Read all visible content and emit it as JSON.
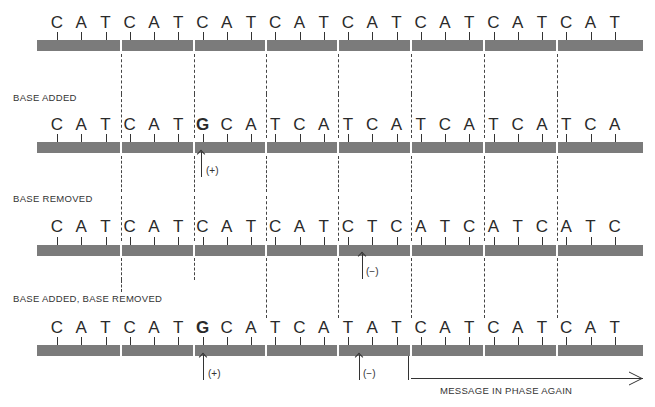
{
  "title_partial": "",
  "rows": [
    {
      "label": "",
      "sequence": [
        "C",
        "A",
        "T",
        "C",
        "A",
        "T",
        "C",
        "A",
        "T",
        "C",
        "A",
        "T",
        "C",
        "A",
        "T",
        "C",
        "A",
        "T",
        "C",
        "A",
        "T",
        "C",
        "A",
        "T"
      ],
      "bold_index": -1
    },
    {
      "label": "BASE ADDED",
      "sequence": [
        "C",
        "A",
        "T",
        "C",
        "A",
        "T",
        "G",
        "C",
        "A",
        "T",
        "C",
        "A",
        "T",
        "C",
        "A",
        "T",
        "C",
        "A",
        "T",
        "C",
        "A",
        "T",
        "C",
        "A"
      ],
      "bold_index": 6
    },
    {
      "label": "BASE REMOVED",
      "sequence": [
        "C",
        "A",
        "T",
        "C",
        "A",
        "T",
        "C",
        "A",
        "T",
        "C",
        "A",
        "T",
        "C",
        "T",
        "C",
        "A",
        "T",
        "C",
        "A",
        "T",
        "C",
        "A",
        "T",
        "C"
      ],
      "bold_index": -1
    },
    {
      "label": "BASE ADDED, BASE REMOVED",
      "sequence": [
        "C",
        "A",
        "T",
        "C",
        "A",
        "T",
        "G",
        "C",
        "A",
        "T",
        "C",
        "A",
        "T",
        "A",
        "T",
        "C",
        "A",
        "T",
        "C",
        "A",
        "T",
        "C",
        "A",
        "T"
      ],
      "bold_index": 6
    }
  ],
  "markers": {
    "added": "(+)",
    "removed": "(−)"
  },
  "phase_note": "MESSAGE IN PHASE AGAIN",
  "colors": {
    "bar": "#7b7b7b",
    "text": "#333333"
  }
}
